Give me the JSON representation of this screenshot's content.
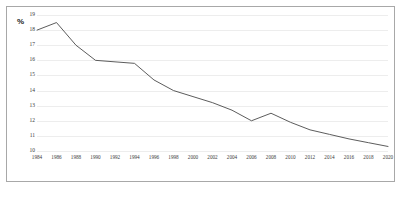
{
  "chart_data": {
    "type": "line",
    "title": "",
    "xlabel": "",
    "ylabel": "%",
    "ylim": [
      10,
      19
    ],
    "ytick_step": 1,
    "grid": true,
    "legend": "none",
    "line_color": "#4a4a4a",
    "categories": [
      "1984",
      "1986",
      "1988",
      "1990",
      "1992",
      "1994",
      "1996",
      "1998",
      "2000",
      "2002",
      "2004",
      "2006",
      "2008",
      "2010",
      "2012",
      "2014",
      "2016",
      "2018",
      "2020"
    ],
    "ytick_labels": [
      "19",
      "18",
      "17",
      "16",
      "15",
      "14",
      "13",
      "12",
      "11",
      "10"
    ],
    "series": [
      {
        "name": "series-1",
        "values": [
          18.0,
          18.5,
          17.0,
          16.0,
          15.9,
          15.8,
          14.7,
          14.0,
          13.6,
          13.2,
          12.7,
          12.0,
          12.5,
          11.9,
          11.4,
          11.1,
          10.8,
          10.55,
          10.3
        ]
      }
    ]
  },
  "axis": {
    "y_unit_label": "%"
  }
}
